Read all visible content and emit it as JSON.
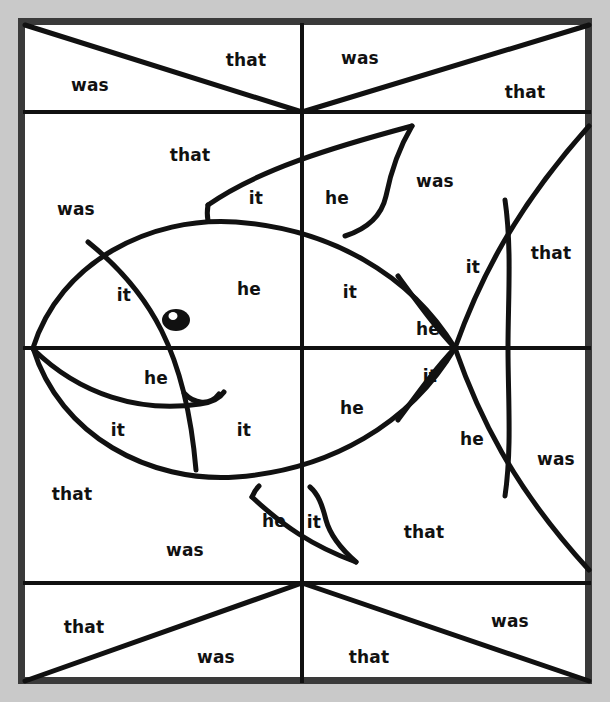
{
  "page": {
    "background_color": "#c9c9c9",
    "paper_color": "#ffffff",
    "ink_color": "#111111",
    "border_color": "#3a3a3a",
    "width": 610,
    "height": 702
  },
  "words": {
    "was": "was",
    "that": "that",
    "it": "it",
    "he": "he"
  },
  "regions": [
    {
      "id": "r01",
      "word": "was",
      "x": 90,
      "y": 86,
      "band": "top-band",
      "cell": "top-left"
    },
    {
      "id": "r02",
      "word": "that",
      "x": 246,
      "y": 61,
      "band": "top-band",
      "cell": "top-left"
    },
    {
      "id": "r03",
      "word": "was",
      "x": 360,
      "y": 59,
      "band": "top-band",
      "cell": "top-right"
    },
    {
      "id": "r04",
      "word": "that",
      "x": 525,
      "y": 93,
      "band": "top-band",
      "cell": "top-right"
    },
    {
      "id": "r05",
      "word": "that",
      "x": 190,
      "y": 156,
      "band": "upper-mid",
      "cell": "upper-left"
    },
    {
      "id": "r06",
      "word": "it",
      "x": 256,
      "y": 199,
      "band": "upper-mid",
      "cell": "upper-left"
    },
    {
      "id": "r07",
      "word": "was",
      "x": 76,
      "y": 210,
      "band": "upper-mid",
      "cell": "upper-left"
    },
    {
      "id": "r08",
      "word": "it",
      "x": 124,
      "y": 296,
      "band": "upper-mid",
      "cell": "upper-left"
    },
    {
      "id": "r09",
      "word": "he",
      "x": 249,
      "y": 290,
      "band": "upper-mid",
      "cell": "upper-left"
    },
    {
      "id": "r10",
      "word": "he",
      "x": 337,
      "y": 199,
      "band": "upper-mid",
      "cell": "upper-right"
    },
    {
      "id": "r11",
      "word": "was",
      "x": 435,
      "y": 182,
      "band": "upper-mid",
      "cell": "upper-right"
    },
    {
      "id": "r12",
      "word": "it",
      "x": 350,
      "y": 293,
      "band": "upper-mid",
      "cell": "upper-right"
    },
    {
      "id": "r13",
      "word": "it",
      "x": 473,
      "y": 268,
      "band": "upper-mid",
      "cell": "upper-right"
    },
    {
      "id": "r14",
      "word": "that",
      "x": 551,
      "y": 254,
      "band": "upper-mid",
      "cell": "upper-right"
    },
    {
      "id": "r15",
      "word": "he",
      "x": 428,
      "y": 330,
      "band": "upper-mid",
      "cell": "upper-right"
    },
    {
      "id": "r16",
      "word": "he",
      "x": 156,
      "y": 379,
      "band": "lower-mid",
      "cell": "lower-left"
    },
    {
      "id": "r17",
      "word": "it",
      "x": 118,
      "y": 431,
      "band": "lower-mid",
      "cell": "lower-left"
    },
    {
      "id": "r18",
      "word": "it",
      "x": 244,
      "y": 431,
      "band": "lower-mid",
      "cell": "lower-left"
    },
    {
      "id": "r19",
      "word": "that",
      "x": 72,
      "y": 495,
      "band": "lower-mid",
      "cell": "lower-left"
    },
    {
      "id": "r20",
      "word": "was",
      "x": 185,
      "y": 551,
      "band": "lower-mid",
      "cell": "lower-left"
    },
    {
      "id": "r21",
      "word": "he",
      "x": 274,
      "y": 522,
      "band": "lower-mid",
      "cell": "lower-left"
    },
    {
      "id": "r22",
      "word": "it",
      "x": 430,
      "y": 377,
      "band": "lower-mid",
      "cell": "lower-right"
    },
    {
      "id": "r23",
      "word": "he",
      "x": 352,
      "y": 409,
      "band": "lower-mid",
      "cell": "lower-right"
    },
    {
      "id": "r24",
      "word": "he",
      "x": 472,
      "y": 440,
      "band": "lower-mid",
      "cell": "lower-right"
    },
    {
      "id": "r25",
      "word": "was",
      "x": 556,
      "y": 460,
      "band": "lower-mid",
      "cell": "lower-right"
    },
    {
      "id": "r26",
      "word": "it",
      "x": 314,
      "y": 523,
      "band": "lower-mid",
      "cell": "lower-right"
    },
    {
      "id": "r27",
      "word": "that",
      "x": 424,
      "y": 533,
      "band": "lower-mid",
      "cell": "lower-right"
    },
    {
      "id": "r28",
      "word": "that",
      "x": 84,
      "y": 628,
      "band": "bottom-band",
      "cell": "bottom-left"
    },
    {
      "id": "r29",
      "word": "was",
      "x": 216,
      "y": 658,
      "band": "bottom-band",
      "cell": "bottom-left"
    },
    {
      "id": "r30",
      "word": "that",
      "x": 369,
      "y": 658,
      "band": "bottom-band",
      "cell": "bottom-right"
    },
    {
      "id": "r31",
      "word": "was",
      "x": 510,
      "y": 622,
      "band": "bottom-band",
      "cell": "bottom-right"
    }
  ],
  "grid": {
    "frame": {
      "x": 18,
      "y": 18,
      "width": 574,
      "height": 666,
      "stroke": 7
    },
    "vertical_center_x": 302,
    "horizontal_lines_y": [
      112,
      348,
      583
    ],
    "line_stroke": 4
  },
  "figure": {
    "name": "fish",
    "eye": {
      "cx": 176,
      "cy": 320,
      "rx": 13,
      "ry": 11,
      "pupil_color": "#ffffff"
    },
    "parts": [
      "body",
      "head-gill",
      "dorsal-fin",
      "ventral-fin",
      "tail",
      "mouth",
      "eye",
      "stripe"
    ]
  }
}
